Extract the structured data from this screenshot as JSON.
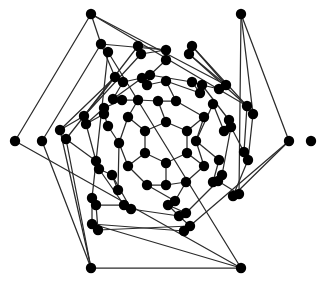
{
  "figure": {
    "kind": "node-link-diagram",
    "width": 326,
    "height": 282,
    "background_color": "#ffffff",
    "vertex_color": "#000000",
    "edge_color": "#2b2b2b",
    "vertex_radius": 5.2,
    "edge_width": 1.25,
    "symmetry": "6-fold rotational (hexagonal)",
    "vertex_count": 80,
    "edge_count": 120
  },
  "chart_data": {
    "type": "scatter",
    "xlabel": "",
    "ylabel": "",
    "xlim": [
      0,
      326
    ],
    "ylim": [
      0,
      282
    ],
    "grid": false,
    "legend": "none",
    "vertices": [
      [
        166,
        122
      ],
      [
        187,
        131
      ],
      [
        187,
        153
      ],
      [
        166,
        163
      ],
      [
        145,
        153
      ],
      [
        145,
        131
      ],
      [
        158,
        101
      ],
      [
        204,
        117
      ],
      [
        204,
        166
      ],
      [
        166,
        185
      ],
      [
        128,
        166
      ],
      [
        128,
        117
      ],
      [
        176,
        101
      ],
      [
        196,
        141
      ],
      [
        186,
        182
      ],
      [
        147,
        185
      ],
      [
        119,
        143
      ],
      [
        138,
        100
      ],
      [
        166,
        81
      ],
      [
        213,
        104
      ],
      [
        219,
        160
      ],
      [
        175,
        201
      ],
      [
        118,
        190
      ],
      [
        108,
        126
      ],
      [
        122,
        100
      ],
      [
        147,
        85
      ],
      [
        200,
        93
      ],
      [
        224,
        131
      ],
      [
        213,
        182
      ],
      [
        168,
        205
      ],
      [
        112,
        175
      ],
      [
        104,
        114
      ],
      [
        104,
        108
      ],
      [
        113,
        99
      ],
      [
        142,
        78
      ],
      [
        150,
        75
      ],
      [
        192,
        82
      ],
      [
        202,
        85
      ],
      [
        229,
        120
      ],
      [
        231,
        127
      ],
      [
        222,
        175
      ],
      [
        218,
        181
      ],
      [
        186,
        213
      ],
      [
        179,
        216
      ],
      [
        131,
        209
      ],
      [
        124,
        205
      ],
      [
        99,
        169
      ],
      [
        96,
        161
      ],
      [
        166,
        60
      ],
      [
        166,
        50
      ],
      [
        123,
        82
      ],
      [
        115,
        77
      ],
      [
        219,
        89
      ],
      [
        226,
        85
      ],
      [
        244,
        152
      ],
      [
        248,
        160
      ],
      [
        190,
        226
      ],
      [
        184,
        231
      ],
      [
        96,
        205
      ],
      [
        92,
        198
      ],
      [
        86,
        124
      ],
      [
        84,
        116
      ],
      [
        141,
        54
      ],
      [
        138,
        46
      ],
      [
        192,
        46
      ],
      [
        189,
        54
      ],
      [
        247,
        106
      ],
      [
        253,
        114
      ],
      [
        239,
        194
      ],
      [
        233,
        196
      ],
      [
        98,
        230
      ],
      [
        92,
        224
      ],
      [
        66,
        139
      ],
      [
        60,
        130
      ],
      [
        108,
        52
      ],
      [
        101,
        44
      ],
      [
        91,
        14
      ],
      [
        241,
        14
      ],
      [
        289,
        141
      ],
      [
        241,
        268
      ],
      [
        91,
        268
      ],
      [
        42,
        141
      ],
      [
        15,
        141
      ],
      [
        311,
        141
      ]
    ],
    "edges": [
      [
        0,
        1
      ],
      [
        1,
        2
      ],
      [
        2,
        3
      ],
      [
        3,
        4
      ],
      [
        4,
        5
      ],
      [
        5,
        0
      ],
      [
        0,
        6
      ],
      [
        1,
        7
      ],
      [
        2,
        8
      ],
      [
        3,
        9
      ],
      [
        4,
        10
      ],
      [
        5,
        11
      ],
      [
        6,
        12
      ],
      [
        6,
        17
      ],
      [
        7,
        12
      ],
      [
        7,
        13
      ],
      [
        8,
        13
      ],
      [
        8,
        14
      ],
      [
        9,
        14
      ],
      [
        9,
        15
      ],
      [
        10,
        15
      ],
      [
        10,
        16
      ],
      [
        11,
        16
      ],
      [
        11,
        17
      ],
      [
        12,
        18
      ],
      [
        13,
        19
      ],
      [
        13,
        20
      ],
      [
        14,
        21
      ],
      [
        15,
        21
      ],
      [
        16,
        22
      ],
      [
        16,
        23
      ],
      [
        17,
        24
      ],
      [
        12,
        18
      ],
      [
        17,
        24
      ],
      [
        18,
        26
      ],
      [
        18,
        25
      ],
      [
        19,
        27
      ],
      [
        20,
        28
      ],
      [
        21,
        29
      ],
      [
        22,
        30
      ],
      [
        23,
        31
      ],
      [
        24,
        32
      ],
      [
        24,
        33
      ],
      [
        25,
        34
      ],
      [
        26,
        36
      ],
      [
        27,
        38
      ],
      [
        28,
        40
      ],
      [
        29,
        42
      ],
      [
        30,
        46
      ],
      [
        31,
        60
      ],
      [
        25,
        18
      ],
      [
        26,
        18
      ],
      [
        33,
        34
      ],
      [
        35,
        36
      ],
      [
        37,
        38
      ],
      [
        39,
        40
      ],
      [
        41,
        42
      ],
      [
        43,
        44
      ],
      [
        45,
        46
      ],
      [
        47,
        60
      ],
      [
        32,
        60
      ],
      [
        31,
        32
      ],
      [
        30,
        44
      ],
      [
        29,
        43
      ],
      [
        28,
        41
      ],
      [
        27,
        39
      ],
      [
        34,
        35
      ],
      [
        36,
        37
      ],
      [
        38,
        39
      ],
      [
        40,
        41
      ],
      [
        42,
        43
      ],
      [
        44,
        45
      ],
      [
        46,
        47
      ],
      [
        35,
        48
      ],
      [
        37,
        52
      ],
      [
        48,
        49
      ],
      [
        52,
        53
      ],
      [
        50,
        51
      ],
      [
        58,
        59
      ],
      [
        33,
        50
      ],
      [
        50,
        34
      ],
      [
        49,
        62
      ],
      [
        49,
        63
      ],
      [
        53,
        64
      ],
      [
        53,
        65
      ],
      [
        62,
        61
      ],
      [
        63,
        61
      ],
      [
        64,
        66
      ],
      [
        65,
        66
      ],
      [
        54,
        55
      ],
      [
        56,
        57
      ],
      [
        39,
        54
      ],
      [
        41,
        68
      ],
      [
        54,
        66
      ],
      [
        55,
        67
      ],
      [
        68,
        69
      ],
      [
        69,
        55
      ],
      [
        56,
        70
      ],
      [
        57,
        71
      ],
      [
        43,
        56
      ],
      [
        45,
        58
      ],
      [
        58,
        70
      ],
      [
        59,
        71
      ],
      [
        51,
        72
      ],
      [
        51,
        73
      ],
      [
        59,
        74
      ],
      [
        47,
        72
      ],
      [
        61,
        73
      ],
      [
        75,
        76
      ],
      [
        77,
        78
      ],
      [
        79,
        80
      ],
      [
        75,
        49
      ],
      [
        75,
        51
      ],
      [
        76,
        53
      ],
      [
        76,
        66
      ],
      [
        77,
        67
      ],
      [
        77,
        68
      ],
      [
        78,
        69
      ],
      [
        78,
        57
      ],
      [
        79,
        71
      ],
      [
        79,
        74
      ],
      [
        80,
        73
      ],
      [
        80,
        72
      ],
      [
        81,
        80
      ],
      [
        82,
        79
      ],
      [
        75,
        81
      ],
      [
        80,
        81
      ],
      [
        79,
        82
      ],
      [
        76,
        82
      ]
    ]
  }
}
